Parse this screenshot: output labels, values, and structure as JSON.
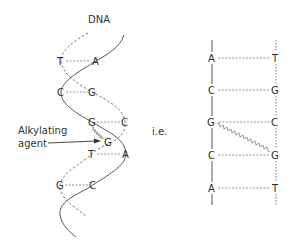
{
  "title": "DNA",
  "annotation": {
    "line1": "Alkylating",
    "line2": "agent"
  },
  "connector": "i.e.",
  "helix": {
    "pairs": [
      {
        "left": "T",
        "right": "A"
      },
      {
        "left": "C",
        "right": "G"
      },
      {
        "left": "G",
        "right": "C"
      },
      {
        "left": "T",
        "right": "A"
      },
      {
        "left": "G",
        "right": "C"
      }
    ],
    "crosslinked_base": "G"
  },
  "ladder": {
    "pairs": [
      {
        "left": "A",
        "right": "T"
      },
      {
        "left": "C",
        "right": "G"
      },
      {
        "left": "G",
        "right": "C"
      },
      {
        "left": "C",
        "right": "G"
      },
      {
        "left": "A",
        "right": "T"
      }
    ],
    "crosslink": {
      "from": "G",
      "to": "G"
    }
  },
  "colors": {
    "strand": "#555555",
    "text": "#2b2b2b",
    "crosslink": "#777777"
  }
}
